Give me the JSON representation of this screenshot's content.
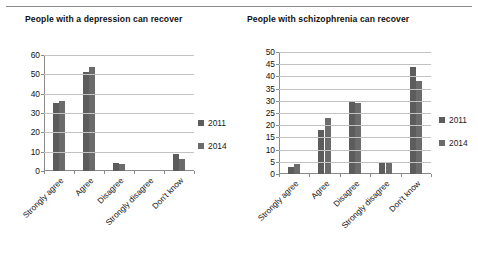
{
  "page": {
    "top_rule": true
  },
  "legend_labels": [
    "2011",
    "2014"
  ],
  "charts": [
    {
      "title": "People with a depression can recover",
      "legend_position": "right"
    },
    {
      "title": "People with schizophrenia can recover",
      "legend_position": "right"
    }
  ],
  "chart_data": [
    {
      "type": "bar",
      "title": "People with a depression can recover",
      "xlabel": "",
      "ylabel": "",
      "ylim": [
        0,
        60
      ],
      "ytick_step": 10,
      "yticks": [
        0,
        10,
        20,
        30,
        40,
        50,
        60
      ],
      "grid": true,
      "legend": [
        "2011",
        "2014"
      ],
      "legend_position": "right",
      "categories": [
        "Strongly agree",
        "Agree",
        "Disagree",
        "Strongly disagree",
        "Don't know"
      ],
      "series": [
        {
          "name": "2011",
          "values": [
            35,
            51,
            4,
            0,
            9
          ]
        },
        {
          "name": "2014",
          "values": [
            36,
            54,
            3.5,
            0,
            6
          ]
        }
      ]
    },
    {
      "type": "bar",
      "title": "People with schizophrenia can recover",
      "xlabel": "",
      "ylabel": "",
      "ylim": [
        0,
        50
      ],
      "ytick_step": 5,
      "yticks": [
        0,
        5,
        10,
        15,
        20,
        25,
        30,
        35,
        40,
        45,
        50
      ],
      "grid": true,
      "legend": [
        "2011",
        "2014"
      ],
      "legend_position": "right",
      "categories": [
        "Strongly agree",
        "Agree",
        "Disagree",
        "Strongly disagree",
        "Don't know"
      ],
      "series": [
        {
          "name": "2011",
          "values": [
            3,
            18,
            30,
            5,
            44
          ]
        },
        {
          "name": "2014",
          "values": [
            4,
            23,
            29,
            5,
            38
          ]
        }
      ]
    }
  ]
}
